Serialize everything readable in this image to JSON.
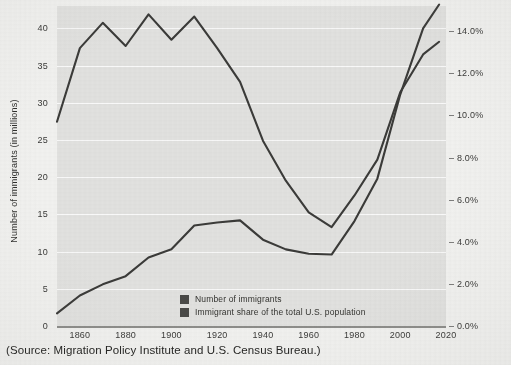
{
  "source_caption": "(Source: Migration Policy Institute and U.S. Census Bureau.)",
  "legend": {
    "items": [
      {
        "label": "Number of immigrants",
        "color": "#4a4a48"
      },
      {
        "label": "Immigrant share of the total U.S. population",
        "color": "#4a4a48"
      }
    ]
  },
  "axes": {
    "left_title": "Number of immigrants (in millions)",
    "right_title": "Immigrant share of the total U.S. population",
    "left_ticks": [
      "0",
      "5",
      "10",
      "15",
      "20",
      "25",
      "30",
      "35",
      "40"
    ],
    "right_ticks": [
      "0.0%",
      "2.0%",
      "4.0%",
      "6.0%",
      "8.0%",
      "10.0%",
      "12.0%",
      "14.0%"
    ],
    "x_ticks": [
      "1860",
      "1880",
      "1900",
      "1920",
      "1940",
      "1960",
      "1980",
      "2000",
      "2020"
    ]
  },
  "colors": {
    "plot_background": "#e2e2e0",
    "page_background": "#f2f2f0",
    "gridline": "#fafafa",
    "line": "#3b3b39",
    "axis": "#8d8d8a",
    "text": "#2b2b2b"
  },
  "chart_data": {
    "type": "line",
    "title": "",
    "subtitle": "",
    "xlabel": "",
    "ylabel": "Number of immigrants (in millions)",
    "y2label": "Immigrant share of the total U.S. population",
    "grid": true,
    "legend_position": "inside-bottom-center",
    "xlim": [
      1850,
      2020
    ],
    "ylim": [
      0,
      43
    ],
    "y2lim": [
      0,
      15.2
    ],
    "x": [
      1850,
      1860,
      1870,
      1880,
      1890,
      1900,
      1910,
      1920,
      1930,
      1940,
      1950,
      1960,
      1970,
      1980,
      1990,
      2000,
      2010,
      2017
    ],
    "series": [
      {
        "name": "Number of immigrants",
        "axis": "left",
        "unit": "millions",
        "values": [
          1.7,
          4.1,
          5.6,
          6.7,
          9.2,
          10.3,
          13.5,
          13.9,
          14.2,
          11.6,
          10.3,
          9.7,
          9.6,
          14.1,
          19.8,
          31.1,
          40.0,
          43.2
        ]
      },
      {
        "name": "Immigrant share of the total U.S. population",
        "axis": "right",
        "unit": "percent",
        "values": [
          9.7,
          13.2,
          14.4,
          13.3,
          14.8,
          13.6,
          14.7,
          13.2,
          11.6,
          8.8,
          6.9,
          5.4,
          4.7,
          6.2,
          7.9,
          11.1,
          12.9,
          13.5
        ]
      }
    ]
  }
}
